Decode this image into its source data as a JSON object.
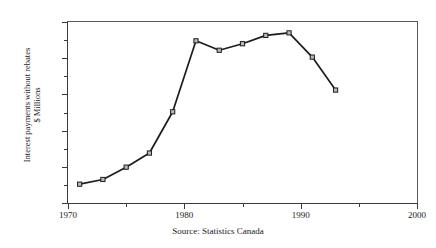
{
  "chart_data": {
    "type": "line",
    "title": "",
    "xlabel": "",
    "ylabel": "Interest payments without rebates $ Millions",
    "ylabel_line1": "Interest payments without rebates",
    "ylabel_line2": "$ Millions",
    "source": "Source: Statistics Canada",
    "x": [
      1971,
      1973,
      1975,
      1977,
      1979,
      1981,
      1983,
      1985,
      1987,
      1989,
      1991,
      1993
    ],
    "values": [
      52,
      65,
      99,
      138,
      252,
      448,
      422,
      440,
      463,
      470,
      403,
      312
    ],
    "series": [
      {
        "name": "Interest payments without rebates",
        "values": [
          52,
          65,
          99,
          138,
          252,
          448,
          422,
          440,
          463,
          470,
          403,
          312
        ]
      }
    ],
    "xlim": [
      1970,
      2000
    ],
    "ylim": [
      0,
      500
    ],
    "xticks": [
      1970,
      1980,
      1990,
      2000
    ],
    "xtick_labels": [
      "1970",
      "1980",
      "1990",
      "2000"
    ],
    "xticks_minor": [
      1975,
      1985,
      1995
    ],
    "yticks": [
      0,
      100,
      200,
      300,
      400,
      500
    ],
    "ytick_labels": [
      "0",
      "100",
      "200",
      "300",
      "400",
      "500"
    ],
    "yticks_minor": [
      50,
      150,
      250,
      350,
      450
    ],
    "grid": false,
    "legend": false,
    "marker": "square",
    "line_color": "#1c1c1c",
    "marker_fill": "#b9b9b9",
    "axis_color": "#3a3a3a",
    "background": "#ffffff"
  }
}
